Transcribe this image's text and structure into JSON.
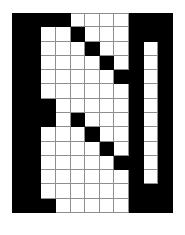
{
  "figure": {
    "glyph": "N",
    "type": "pixel-grid",
    "columns": 11,
    "rows": 14,
    "colors": {
      "filled": "#000000",
      "empty": "#ffffff",
      "gridline": "#8e8e8e",
      "background": "#ffffff"
    },
    "cell_size_px": 14.6,
    "grid_origin_px": {
      "x": 12,
      "y": 13
    },
    "grid_size_px": {
      "width": 161,
      "height": 200
    },
    "legend": {
      "filled_label": "filled cell",
      "empty_label": "empty cell"
    },
    "matrix": [
      [
        1,
        1,
        1,
        1,
        0,
        0,
        0,
        0,
        1,
        1,
        1
      ],
      [
        1,
        1,
        0,
        0,
        1,
        0,
        0,
        0,
        1,
        1,
        1
      ],
      [
        1,
        1,
        0,
        0,
        0,
        1,
        0,
        0,
        1,
        0,
        1
      ],
      [
        1,
        1,
        0,
        0,
        0,
        0,
        1,
        0,
        1,
        0,
        1
      ],
      [
        1,
        1,
        0,
        0,
        0,
        0,
        0,
        1,
        1,
        0,
        1
      ],
      [
        1,
        1,
        0,
        0,
        0,
        0,
        0,
        0,
        1,
        0,
        1
      ],
      [
        1,
        1,
        1,
        0,
        0,
        0,
        0,
        0,
        1,
        0,
        1
      ],
      [
        1,
        1,
        1,
        0,
        1,
        0,
        0,
        0,
        1,
        0,
        1
      ],
      [
        1,
        1,
        0,
        0,
        0,
        1,
        0,
        0,
        1,
        0,
        1
      ],
      [
        1,
        1,
        0,
        0,
        0,
        0,
        1,
        0,
        1,
        0,
        1
      ],
      [
        1,
        1,
        0,
        0,
        0,
        0,
        0,
        1,
        1,
        0,
        1
      ],
      [
        1,
        1,
        0,
        0,
        0,
        0,
        0,
        0,
        1,
        0,
        1
      ],
      [
        1,
        1,
        0,
        0,
        0,
        0,
        0,
        0,
        1,
        1,
        1
      ],
      [
        1,
        1,
        1,
        0,
        0,
        0,
        0,
        0,
        1,
        1,
        1
      ]
    ]
  }
}
